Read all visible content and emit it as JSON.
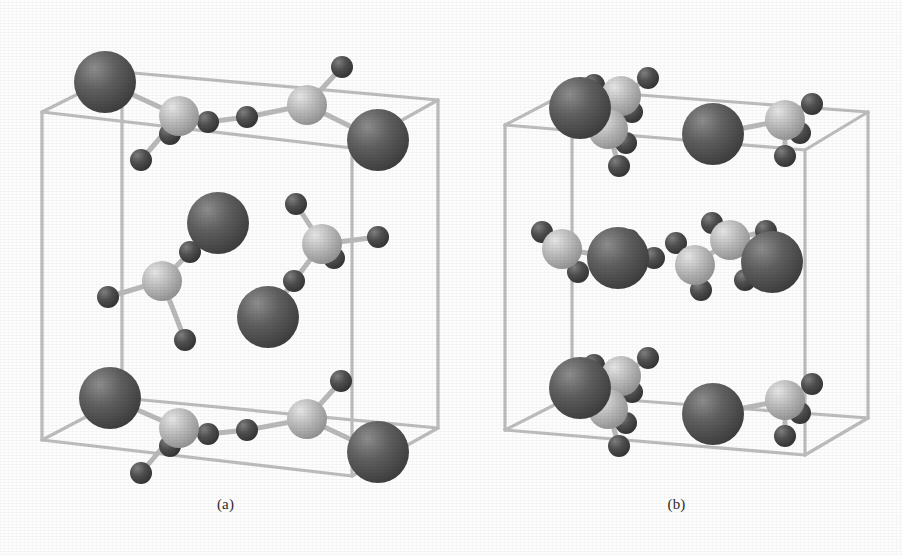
{
  "figure": {
    "background_color": "#fdfdfd",
    "width": 902,
    "height": 555,
    "kind": "crystal-structure-unit-cell-pair"
  },
  "panels": [
    {
      "id": "a",
      "label": "(a)",
      "cell_shape": "orthorhombic-prism"
    },
    {
      "id": "b",
      "label": "(b)",
      "cell_shape": "orthorhombic-prism"
    }
  ],
  "atom_types": {
    "large": {
      "name": "large-dark-sphere",
      "color": "#5b5b5b",
      "highlight": "#8d8d8d",
      "shadow": "#3a3a3a",
      "radius": 31
    },
    "medium": {
      "name": "medium-light-sphere",
      "color": "#b6b6b6",
      "highlight": "#e4e4e4",
      "shadow": "#8a8a8a",
      "radius": 20
    },
    "small": {
      "name": "small-dark-sphere",
      "color": "#4d4d4d",
      "highlight": "#7e7e7e",
      "shadow": "#2e2e2e",
      "radius": 11
    }
  },
  "bond": {
    "color": "#b9b9b9",
    "edge_color": "#9b9b9b",
    "width": 5
  },
  "cell_frame": {
    "color": "#bdbdbd",
    "width": 3.2
  },
  "structure_data": {
    "panel_a": {
      "cell_corners": {
        "front_top_left": [
          42,
          112
        ],
        "front_top_right": [
          352,
          148
        ],
        "front_bottom_left": [
          42,
          440
        ],
        "front_bottom_right": [
          352,
          476
        ],
        "back_top_left": [
          122,
          72
        ],
        "back_top_right": [
          438,
          100
        ],
        "back_bottom_left": [
          122,
          398
        ],
        "back_bottom_right": [
          438,
          428
        ]
      },
      "atoms": [
        {
          "type": "large",
          "x": 105,
          "y": 82
        },
        {
          "type": "medium",
          "x": 179,
          "y": 116
        },
        {
          "type": "small",
          "x": 208,
          "y": 122
        },
        {
          "type": "small",
          "x": 247,
          "y": 117
        },
        {
          "type": "small",
          "x": 170,
          "y": 134
        },
        {
          "type": "small",
          "x": 141,
          "y": 160
        },
        {
          "type": "medium",
          "x": 307,
          "y": 105
        },
        {
          "type": "small",
          "x": 342,
          "y": 67
        },
        {
          "type": "large",
          "x": 378,
          "y": 140
        },
        {
          "type": "large",
          "x": 218,
          "y": 223
        },
        {
          "type": "small",
          "x": 190,
          "y": 252
        },
        {
          "type": "medium",
          "x": 162,
          "y": 281
        },
        {
          "type": "small",
          "x": 108,
          "y": 297
        },
        {
          "type": "small",
          "x": 185,
          "y": 340
        },
        {
          "type": "medium",
          "x": 322,
          "y": 244
        },
        {
          "type": "small",
          "x": 296,
          "y": 204
        },
        {
          "type": "small",
          "x": 334,
          "y": 258
        },
        {
          "type": "small",
          "x": 378,
          "y": 237
        },
        {
          "type": "small",
          "x": 294,
          "y": 281
        },
        {
          "type": "large",
          "x": 268,
          "y": 317
        },
        {
          "type": "large",
          "x": 110,
          "y": 398
        },
        {
          "type": "medium",
          "x": 179,
          "y": 428
        },
        {
          "type": "small",
          "x": 208,
          "y": 434
        },
        {
          "type": "small",
          "x": 247,
          "y": 430
        },
        {
          "type": "small",
          "x": 170,
          "y": 446
        },
        {
          "type": "small",
          "x": 141,
          "y": 473
        },
        {
          "type": "medium",
          "x": 307,
          "y": 419
        },
        {
          "type": "small",
          "x": 341,
          "y": 381
        },
        {
          "type": "large",
          "x": 378,
          "y": 452
        }
      ],
      "bonds": [
        [
          1,
          2
        ],
        [
          2,
          3
        ],
        [
          3,
          6
        ],
        [
          1,
          4
        ],
        [
          1,
          5
        ],
        [
          6,
          7
        ],
        [
          6,
          8
        ],
        [
          0,
          1
        ],
        [
          11,
          10
        ],
        [
          10,
          9
        ],
        [
          11,
          12
        ],
        [
          11,
          13
        ],
        [
          14,
          15
        ],
        [
          14,
          16
        ],
        [
          14,
          17
        ],
        [
          14,
          18
        ],
        [
          18,
          19
        ],
        [
          22,
          21
        ],
        [
          22,
          23
        ],
        [
          23,
          26
        ],
        [
          21,
          24
        ],
        [
          21,
          25
        ],
        [
          26,
          27
        ],
        [
          26,
          28
        ],
        [
          20,
          21
        ]
      ]
    },
    "panel_b": {
      "cell_corners": {
        "front_top_left": [
          505,
          125
        ],
        "front_top_right": [
          805,
          150
        ],
        "front_bottom_left": [
          505,
          430
        ],
        "front_bottom_right": [
          805,
          455
        ],
        "back_top_left": [
          572,
          90
        ],
        "back_top_right": [
          868,
          112
        ],
        "back_bottom_left": [
          572,
          396
        ],
        "back_bottom_right": [
          868,
          418
        ]
      },
      "atoms": [
        {
          "type": "large",
          "x": 580,
          "y": 108
        },
        {
          "type": "medium",
          "x": 621,
          "y": 96
        },
        {
          "type": "small",
          "x": 594,
          "y": 85
        },
        {
          "type": "small",
          "x": 648,
          "y": 78
        },
        {
          "type": "small",
          "x": 632,
          "y": 112
        },
        {
          "type": "medium",
          "x": 608,
          "y": 129
        },
        {
          "type": "small",
          "x": 626,
          "y": 143
        },
        {
          "type": "small",
          "x": 619,
          "y": 166
        },
        {
          "type": "large",
          "x": 713,
          "y": 134
        },
        {
          "type": "medium",
          "x": 785,
          "y": 120
        },
        {
          "type": "small",
          "x": 812,
          "y": 104
        },
        {
          "type": "small",
          "x": 800,
          "y": 133
        },
        {
          "type": "small",
          "x": 785,
          "y": 156
        },
        {
          "type": "medium",
          "x": 562,
          "y": 249
        },
        {
          "type": "small",
          "x": 542,
          "y": 232
        },
        {
          "type": "small",
          "x": 578,
          "y": 272
        },
        {
          "type": "large",
          "x": 618,
          "y": 258
        },
        {
          "type": "small",
          "x": 629,
          "y": 240
        },
        {
          "type": "small",
          "x": 654,
          "y": 258
        },
        {
          "type": "medium",
          "x": 695,
          "y": 265
        },
        {
          "type": "small",
          "x": 676,
          "y": 243
        },
        {
          "type": "small",
          "x": 701,
          "y": 290
        },
        {
          "type": "medium",
          "x": 730,
          "y": 240
        },
        {
          "type": "small",
          "x": 712,
          "y": 223
        },
        {
          "type": "small",
          "x": 766,
          "y": 231
        },
        {
          "type": "large",
          "x": 772,
          "y": 262
        },
        {
          "type": "small",
          "x": 745,
          "y": 280
        },
        {
          "type": "large",
          "x": 580,
          "y": 388
        },
        {
          "type": "medium",
          "x": 621,
          "y": 376
        },
        {
          "type": "small",
          "x": 594,
          "y": 365
        },
        {
          "type": "small",
          "x": 648,
          "y": 358
        },
        {
          "type": "small",
          "x": 632,
          "y": 392
        },
        {
          "type": "medium",
          "x": 608,
          "y": 409
        },
        {
          "type": "small",
          "x": 626,
          "y": 423
        },
        {
          "type": "small",
          "x": 619,
          "y": 446
        },
        {
          "type": "large",
          "x": 713,
          "y": 414
        },
        {
          "type": "medium",
          "x": 785,
          "y": 400
        },
        {
          "type": "small",
          "x": 812,
          "y": 384
        },
        {
          "type": "small",
          "x": 800,
          "y": 413
        },
        {
          "type": "small",
          "x": 785,
          "y": 436
        }
      ],
      "bonds": [
        [
          1,
          2
        ],
        [
          1,
          3
        ],
        [
          1,
          4
        ],
        [
          1,
          5
        ],
        [
          5,
          0
        ],
        [
          5,
          6
        ],
        [
          5,
          7
        ],
        [
          9,
          10
        ],
        [
          9,
          11
        ],
        [
          9,
          12
        ],
        [
          9,
          8
        ],
        [
          13,
          14
        ],
        [
          13,
          15
        ],
        [
          13,
          16
        ],
        [
          16,
          17
        ],
        [
          17,
          18
        ],
        [
          19,
          20
        ],
        [
          19,
          21
        ],
        [
          19,
          22
        ],
        [
          22,
          23
        ],
        [
          22,
          24
        ],
        [
          22,
          25
        ],
        [
          25,
          26
        ],
        [
          28,
          29
        ],
        [
          28,
          30
        ],
        [
          28,
          31
        ],
        [
          28,
          32
        ],
        [
          32,
          27
        ],
        [
          32,
          33
        ],
        [
          32,
          34
        ],
        [
          36,
          37
        ],
        [
          36,
          38
        ],
        [
          36,
          39
        ],
        [
          36,
          35
        ]
      ]
    }
  }
}
